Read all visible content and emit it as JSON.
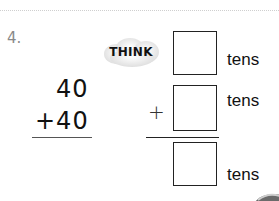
{
  "problem": {
    "number": "4.",
    "addend1": "40",
    "addend2": "+40",
    "think_label": "THINK",
    "boxes": [
      {
        "value": "",
        "unit": "tens"
      },
      {
        "value": "",
        "unit": "tens",
        "operator": "+"
      },
      {
        "value": "",
        "unit": "tens"
      }
    ]
  }
}
